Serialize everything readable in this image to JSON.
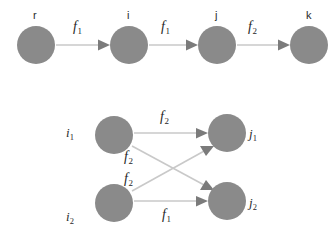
{
  "figure": {
    "background_color": "#ffffff",
    "node_fill_color": "#8a8a8a",
    "edge_line_color": "#c9c9c9",
    "arrowhead_color": "#7b7b7b",
    "node_radius": 19
  },
  "top_graph": {
    "name": "chain-graph",
    "nodes": [
      {
        "id": "r",
        "label": "r",
        "cx": 36,
        "cy": 45
      },
      {
        "id": "i",
        "label": "i",
        "cx": 129,
        "cy": 45
      },
      {
        "id": "j",
        "label": "j",
        "cx": 217,
        "cy": 45
      },
      {
        "id": "k",
        "label": "k",
        "cx": 309,
        "cy": 45
      }
    ],
    "edges": [
      {
        "from": "r",
        "to": "i",
        "label": "f",
        "subscript": "1"
      },
      {
        "from": "i",
        "to": "j",
        "label": "f",
        "subscript": "1"
      },
      {
        "from": "j",
        "to": "k",
        "label": "f",
        "subscript": "2"
      }
    ],
    "edge_labels": [
      {
        "text": "f",
        "subscript": "1",
        "x": 73,
        "y": 20
      },
      {
        "text": "f",
        "subscript": "1",
        "x": 161,
        "y": 20
      },
      {
        "text": "f",
        "subscript": "2",
        "x": 248,
        "y": 20
      }
    ]
  },
  "bottom_graph": {
    "name": "bipartite-graph",
    "nodes": [
      {
        "id": "i1",
        "label": "i",
        "subscript": "1",
        "cx": 114,
        "cy": 135,
        "label_x": 66,
        "label_y": 126
      },
      {
        "id": "i2",
        "label": "i",
        "subscript": "2",
        "cx": 114,
        "cy": 203,
        "label_x": 66,
        "label_y": 210
      },
      {
        "id": "j1",
        "label": "j",
        "subscript": "1",
        "cx": 227,
        "cy": 133,
        "label_x": 249,
        "label_y": 132
      },
      {
        "id": "j2",
        "label": "j",
        "subscript": "2",
        "cx": 227,
        "cy": 201,
        "label_x": 249,
        "label_y": 203
      }
    ],
    "edges": [
      {
        "from": "i1",
        "to": "j1",
        "label": "f",
        "subscript": "2"
      },
      {
        "from": "i1",
        "to": "j2",
        "label": "f",
        "subscript": "2"
      },
      {
        "from": "i2",
        "to": "j1",
        "label": "f",
        "subscript": "2"
      },
      {
        "from": "i2",
        "to": "j2",
        "label": "f",
        "subscript": "1"
      }
    ],
    "edge_labels": [
      {
        "text": "f",
        "subscript": "2",
        "x": 160,
        "y": 110
      },
      {
        "text": "f",
        "subscript": "2",
        "x": 124,
        "y": 150
      },
      {
        "text": "f",
        "subscript": "2",
        "x": 124,
        "y": 172
      },
      {
        "text": "f",
        "subscript": "1",
        "x": 162,
        "y": 208
      }
    ]
  }
}
